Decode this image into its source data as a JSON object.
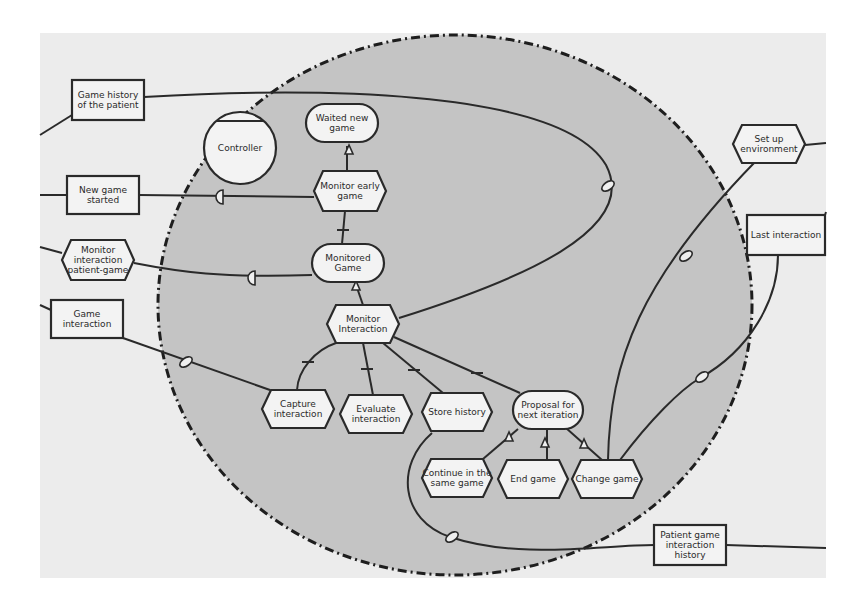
{
  "diagram": {
    "title": "",
    "colors": {
      "background": "#ececec",
      "boundary_fill": "#c4c4c4",
      "node_fill": "#f3f3f3",
      "stroke": "#2a2a2a"
    },
    "boundary": {
      "cx": 455,
      "cy": 305,
      "rx": 297,
      "ry": 270,
      "style": "dash-dot"
    },
    "agents": [
      {
        "id": "controller",
        "label": "Controller",
        "x": 240,
        "y": 148,
        "r": 36
      }
    ],
    "resources": [
      {
        "id": "game-history",
        "lines": [
          "Game history",
          "of the patient"
        ],
        "x": 72,
        "y": 80,
        "w": 72,
        "h": 40
      },
      {
        "id": "new-game-started",
        "lines": [
          "New game",
          "started"
        ],
        "x": 67,
        "y": 176,
        "w": 72,
        "h": 38
      },
      {
        "id": "game-interaction",
        "lines": [
          "Game",
          "interaction"
        ],
        "x": 51,
        "y": 300,
        "w": 72,
        "h": 38
      },
      {
        "id": "last-interaction",
        "lines": [
          "Last interaction"
        ],
        "x": 747,
        "y": 215,
        "w": 78,
        "h": 40
      },
      {
        "id": "patient-game-history",
        "lines": [
          "Patient game",
          "interaction",
          "history"
        ],
        "x": 654,
        "y": 525,
        "w": 72,
        "h": 40
      }
    ],
    "goals": [
      {
        "id": "waited-new-game",
        "lines": [
          "Waited new",
          "game"
        ],
        "x": 306,
        "y": 104,
        "w": 72,
        "h": 38
      },
      {
        "id": "monitored-game",
        "lines": [
          "Monitored",
          "Game"
        ],
        "x": 312,
        "y": 244,
        "w": 72,
        "h": 38
      },
      {
        "id": "proposal-next-iteration",
        "lines": [
          "Proposal for",
          "next iteration"
        ],
        "x": 513,
        "y": 391,
        "w": 70,
        "h": 38
      }
    ],
    "tasks": [
      {
        "id": "monitor-early-game",
        "lines": [
          "Monitor early",
          "game"
        ],
        "x": 314,
        "y": 171,
        "w": 72,
        "h": 40
      },
      {
        "id": "monitor-interaction",
        "lines": [
          "Monitor",
          "Interaction"
        ],
        "x": 327,
        "y": 305,
        "w": 72,
        "h": 38
      },
      {
        "id": "monitor-interaction-patient-game",
        "lines": [
          "Monitor",
          "interaction",
          "patient-game"
        ],
        "x": 62,
        "y": 240,
        "w": 72,
        "h": 40
      },
      {
        "id": "set-up-environment",
        "lines": [
          "Set up",
          "environment"
        ],
        "x": 733,
        "y": 125,
        "w": 72,
        "h": 38
      },
      {
        "id": "capture-interaction",
        "lines": [
          "Capture",
          "interaction"
        ],
        "x": 262,
        "y": 390,
        "w": 72,
        "h": 38
      },
      {
        "id": "evaluate-interaction",
        "lines": [
          "Evaluate",
          "interaction"
        ],
        "x": 340,
        "y": 395,
        "w": 72,
        "h": 38
      },
      {
        "id": "store-history",
        "lines": [
          "Store history"
        ],
        "x": 422,
        "y": 393,
        "w": 70,
        "h": 38
      },
      {
        "id": "continue-same-game",
        "lines": [
          "Continue in the",
          "same game"
        ],
        "x": 422,
        "y": 459,
        "w": 70,
        "h": 38
      },
      {
        "id": "end-game",
        "lines": [
          "End game"
        ],
        "x": 498,
        "y": 460,
        "w": 70,
        "h": 38
      },
      {
        "id": "change-game",
        "lines": [
          "Change game"
        ],
        "x": 572,
        "y": 460,
        "w": 70,
        "h": 38
      }
    ],
    "edges": [
      {
        "id": "e1",
        "d": "M 144 97 C 300 88, 560 86, 606 165 C 640 230, 520 280, 399 318",
        "marker": {
          "type": "contribution",
          "x": 608,
          "y": 186
        }
      },
      {
        "id": "e2",
        "d": "M 72 115 L 40 135"
      },
      {
        "id": "e3",
        "d": "M 40 195 L 67 195"
      },
      {
        "id": "e4",
        "d": "M 139 195 L 314 197",
        "marker": {
          "type": "dependency",
          "x": 223,
          "y": 197
        }
      },
      {
        "id": "e5",
        "d": "M 40 247 L 62 253"
      },
      {
        "id": "e6",
        "d": "M 134 263 C 180 272, 220 278, 312 275",
        "marker": {
          "type": "dependency",
          "x": 255,
          "y": 278
        }
      },
      {
        "id": "e7",
        "d": "M 40 305 L 51 310"
      },
      {
        "id": "e8",
        "d": "M 123 338 L 270 390",
        "marker": {
          "type": "contribution",
          "x": 186,
          "y": 362
        }
      },
      {
        "id": "e9",
        "d": "M 347 171 L 347 146",
        "marker": {
          "type": "arrow",
          "x": 349,
          "y": 150
        }
      },
      {
        "id": "e10",
        "d": "M 345 211 L 342 244",
        "marker": {
          "type": "tick",
          "x": 343,
          "y": 230
        }
      },
      {
        "id": "e11",
        "d": "M 363 305 L 355 282",
        "marker": {
          "type": "arrow",
          "x": 356,
          "y": 286
        }
      },
      {
        "id": "e12",
        "d": "M 336 343 C 315 350, 298 370, 297 390",
        "marker": {
          "type": "tick",
          "x": 308,
          "y": 362
        }
      },
      {
        "id": "e13",
        "d": "M 363 343 L 373 395",
        "marker": {
          "type": "tick",
          "x": 367,
          "y": 369
        }
      },
      {
        "id": "e14",
        "d": "M 383 343 L 443 393",
        "marker": {
          "type": "tick",
          "x": 414,
          "y": 370
        }
      },
      {
        "id": "e15",
        "d": "M 394 337 L 520 393",
        "marker": {
          "type": "tick",
          "x": 477,
          "y": 373
        }
      },
      {
        "id": "e16",
        "d": "M 432 433 C 395 465, 400 520, 450 537 C 520 560, 600 545, 654 545",
        "marker": {
          "type": "contribution",
          "x": 452,
          "y": 537
        }
      },
      {
        "id": "e17",
        "d": "M 726 545 L 826 548"
      },
      {
        "id": "e18",
        "d": "M 483 459 L 518 429",
        "marker": {
          "type": "arrow",
          "x": 509,
          "y": 437
        }
      },
      {
        "id": "e19",
        "d": "M 547 460 L 547 430",
        "marker": {
          "type": "arrow",
          "x": 545,
          "y": 443
        }
      },
      {
        "id": "e20",
        "d": "M 602 460 L 566 428",
        "marker": {
          "type": "arrow",
          "x": 584,
          "y": 444
        }
      },
      {
        "id": "e21",
        "d": "M 608 460 C 610 360, 640 280, 755 162",
        "marker": {
          "type": "contribution",
          "x": 686,
          "y": 256
        }
      },
      {
        "id": "e22",
        "d": "M 620 460 C 650 420, 680 390, 700 378 C 750 350, 778 300, 778 255",
        "marker": {
          "type": "contribution",
          "x": 702,
          "y": 377
        }
      },
      {
        "id": "e23",
        "d": "M 805 145 L 826 143"
      },
      {
        "id": "e24",
        "d": "M 825 215 L 826 212"
      }
    ]
  }
}
